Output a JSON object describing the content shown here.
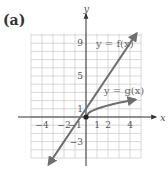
{
  "panel_label": "(a)",
  "chart_data": {
    "type": "line",
    "title": "",
    "xlabel": "x",
    "ylabel": "y",
    "xlim": [
      -5,
      5
    ],
    "ylim": [
      -5,
      10
    ],
    "grid": true,
    "x_ticks": [
      -4,
      -2,
      -1,
      1,
      2,
      4
    ],
    "x_tick_labels": [
      "-4",
      "-2",
      "-1",
      "1",
      "2",
      "4"
    ],
    "y_ticks": [
      9,
      5,
      1,
      -3
    ],
    "y_tick_labels": [
      "9",
      "5",
      "1",
      "-3"
    ],
    "series": [
      {
        "name": "y = f(x)",
        "label": "y = f(x)",
        "formula": "2x + 1",
        "x": [
          -3.4,
          -2,
          -1,
          0,
          1,
          2,
          3,
          4,
          4.6
        ],
        "y": [
          -5.8,
          -3,
          -1,
          1,
          3,
          5,
          7,
          9,
          10.2
        ],
        "arrow_ends": "both",
        "color": "#6e6e6e"
      },
      {
        "name": "y = g(x)",
        "label": "y = g(x)",
        "formula": "sqrt(x)",
        "x": [
          0,
          0.25,
          0.5,
          1,
          1.5,
          2,
          2.5,
          3,
          3.5,
          4,
          4.5
        ],
        "y": [
          0,
          0.5,
          0.707,
          1,
          1.225,
          1.414,
          1.581,
          1.732,
          1.871,
          2,
          2.121
        ],
        "start_point": [
          0,
          0
        ],
        "start_marker": "filled-dot",
        "arrow_ends": "right",
        "color": "#6e6e6e"
      }
    ]
  }
}
